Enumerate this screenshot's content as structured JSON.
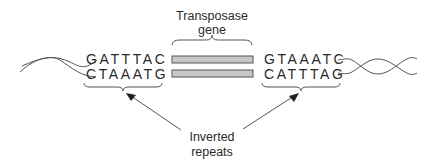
{
  "labels": {
    "transposase_gene_line1": "Transposase",
    "transposase_gene_line2": "gene",
    "inverted_repeats_line1": "Inverted",
    "inverted_repeats_line2": "repeats"
  },
  "left_repeat": {
    "top_strand": "GATTTAC",
    "bottom_strand": "CTAAATG"
  },
  "right_repeat": {
    "top_strand": "GTAAATC",
    "bottom_strand": "CATTTAG"
  },
  "colors": {
    "gene_bar_fill": "#c8c8c8",
    "line": "#555555",
    "text": "#2a2a2a"
  }
}
